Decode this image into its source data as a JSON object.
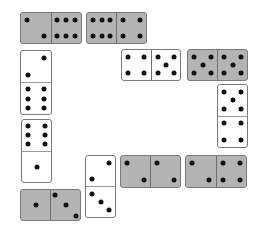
{
  "colors": {
    "gray": "#b4b4b4",
    "white": "#ffffff",
    "pip": "#111111"
  },
  "dominoes": [
    {
      "id": "d1",
      "orientation": "h",
      "color": "gray",
      "x": 20,
      "y": 12,
      "w": 62,
      "h": 32,
      "halves": [
        2,
        6
      ]
    },
    {
      "id": "d2",
      "orientation": "h",
      "color": "gray",
      "x": 86,
      "y": 12,
      "w": 61,
      "h": 32,
      "halves": [
        6,
        4
      ]
    },
    {
      "id": "d3",
      "orientation": "h",
      "color": "white",
      "x": 121,
      "y": 49,
      "w": 60,
      "h": 32,
      "halves": [
        4,
        5
      ]
    },
    {
      "id": "d4",
      "orientation": "h",
      "color": "gray",
      "x": 187,
      "y": 49,
      "w": 61,
      "h": 32,
      "halves": [
        5,
        5
      ]
    },
    {
      "id": "d5",
      "orientation": "v",
      "color": "white",
      "x": 217,
      "y": 84,
      "w": 31,
      "h": 64,
      "halves": [
        5,
        4
      ]
    },
    {
      "id": "d6",
      "orientation": "v",
      "color": "white",
      "x": 20,
      "y": 50,
      "w": 32,
      "h": 65,
      "halves": [
        2,
        6
      ]
    },
    {
      "id": "d7",
      "orientation": "v",
      "color": "white",
      "x": 21,
      "y": 119,
      "w": 31,
      "h": 64,
      "halves": [
        6,
        1
      ]
    },
    {
      "id": "d8",
      "orientation": "h",
      "color": "gray",
      "x": 20,
      "y": 189,
      "w": 61,
      "h": 32,
      "halves": [
        1,
        3
      ]
    },
    {
      "id": "d9",
      "orientation": "v",
      "color": "white",
      "x": 85,
      "y": 155,
      "w": 31,
      "h": 63,
      "halves": [
        2,
        3
      ]
    },
    {
      "id": "d10",
      "orientation": "h",
      "color": "gray",
      "x": 120,
      "y": 155,
      "w": 61,
      "h": 33,
      "halves": [
        2,
        2
      ]
    },
    {
      "id": "d11",
      "orientation": "h",
      "color": "gray",
      "x": 185,
      "y": 155,
      "w": 62,
      "h": 33,
      "halves": [
        2,
        4
      ]
    }
  ]
}
